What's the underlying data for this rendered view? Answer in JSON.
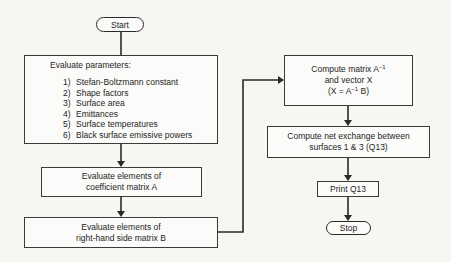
{
  "flowchart": {
    "start": {
      "label": "Start"
    },
    "evaluate_parameters": {
      "title": "Evaluate parameters:",
      "items": [
        {
          "n": "1)",
          "text": "Stefan-Boltzmann constant"
        },
        {
          "n": "2)",
          "text": "Shape factors"
        },
        {
          "n": "3)",
          "text": "Surface area"
        },
        {
          "n": "4)",
          "text": "Emittances"
        },
        {
          "n": "5)",
          "text": "Surface temperatures"
        },
        {
          "n": "6)",
          "text": "Black surface emissive powers"
        }
      ]
    },
    "coefficient_matrix": {
      "line1": "Evaluate elements of",
      "line2": "coefficient matrix A"
    },
    "rhs_matrix": {
      "line1": "Evaluate elements of",
      "line2": "right-hand side matrix B"
    },
    "compute_inverse": {
      "line1_pre": "Compute matrix  A",
      "line1_sup": "−1",
      "line2": "and vector X",
      "line3_pre": "(X = A",
      "line3_sup": "−1",
      "line3_post": " B)"
    },
    "net_exchange": {
      "line1": "Compute net exchange between",
      "line2": "surfaces 1 & 3 (Q13)"
    },
    "print": {
      "label": "Print Q13"
    },
    "stop": {
      "label": "Stop"
    }
  },
  "colors": {
    "line": "#2a2a2a",
    "background": "#f7f6f3",
    "box_fill": "#fbfbf9"
  }
}
